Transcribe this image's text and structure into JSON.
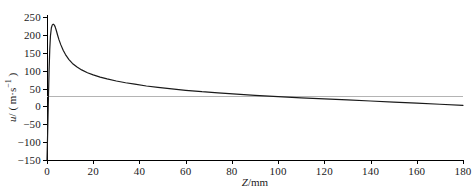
{
  "chart_data": {
    "type": "line",
    "title": "",
    "xlabel": "Z/mm",
    "ylabel": "u/ ( m·s⁻¹ )",
    "xlim": [
      0,
      180
    ],
    "ylim": [
      -150,
      250
    ],
    "grid": false,
    "legend": false,
    "xticks": [
      0,
      20,
      40,
      60,
      80,
      100,
      120,
      140,
      160,
      180
    ],
    "yticks": [
      250,
      200,
      150,
      100,
      50,
      0,
      -50,
      -100,
      -150
    ],
    "xtick_labels": [
      "0",
      "20",
      "40",
      "60",
      "80",
      "100",
      "120",
      "140",
      "160",
      "180"
    ],
    "ytick_labels": [
      "250",
      "200",
      "150",
      "100",
      "50",
      "0",
      "-50",
      "-100",
      "-150"
    ],
    "zero_line": {
      "value": 0,
      "color": "#b4b4b4"
    },
    "series": [
      {
        "name": "u",
        "color": "#1a1a1a",
        "x": [
          0.0,
          0.3,
          0.6,
          0.9,
          1.2,
          1.5,
          1.9,
          2.3,
          2.7,
          3.1,
          3.5,
          4.0,
          4.6,
          5.2,
          6.0,
          7.0,
          8.0,
          9.5,
          11.0,
          13.0,
          15.0,
          17.5,
          20.0,
          23.0,
          26.0,
          30.0,
          34.0,
          38.0,
          43.0,
          48.0,
          54.0,
          60.0,
          67.0,
          74.0,
          82.0,
          90.0,
          100.0,
          110.0,
          120.0,
          130.0,
          140.0,
          150.0,
          160.0,
          170.0,
          180.0
        ],
        "y": [
          -150,
          -70,
          20,
          100,
          160,
          198,
          220,
          228,
          230,
          228,
          223,
          213,
          199,
          186,
          172,
          157,
          145,
          131,
          120,
          110,
          102,
          94,
          88,
          82,
          77,
          71,
          66,
          62,
          57,
          53,
          49,
          45,
          41,
          38,
          34,
          31,
          27,
          24,
          21,
          18,
          15,
          12,
          9,
          6,
          3
        ]
      }
    ],
    "annotations": {
      "peak_value": 230,
      "peak_x": 3,
      "start_value": -150
    }
  },
  "axis_title_y_parts": {
    "symbol": "u",
    "rest": "/ ( m·s"
  }
}
